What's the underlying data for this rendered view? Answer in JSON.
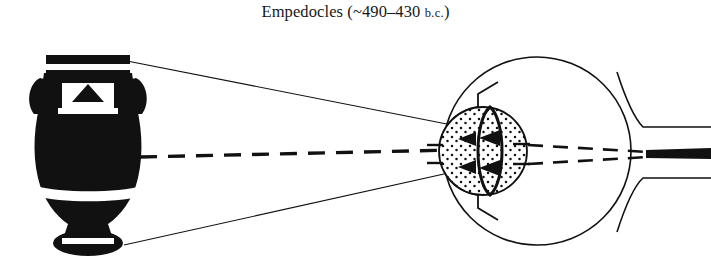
{
  "figure": {
    "caption_main": "Empedocles (~490–430 ",
    "caption_smallcaps": "b.c.",
    "caption_tail": ")",
    "caption_full": "Empedocles (~490–430 B.C.)",
    "background_color": "#ffffff",
    "ink_color": "#111111"
  },
  "objects": {
    "vase": {
      "name": "greek-amphora",
      "description": "black-figure amphora with white decorative bands",
      "fill_color": "#111111",
      "band_color": "#ffffff",
      "motif": "triangle-zigzag"
    },
    "eye": {
      "name": "human-eye-cross-section",
      "description": "eyeball sphere with stippled cornea region and lens",
      "outline_color": "#111111",
      "stipple_color": "#111111",
      "optic_nerve_color": "#111111"
    },
    "optic_nerve": {
      "name": "optic-nerve",
      "label": "optic nerve"
    }
  },
  "rays": {
    "visual_ray": {
      "name": "visual-ray-dashed-arrow",
      "style": "dashed",
      "direction": "eye-to-object",
      "arrowhead": "left",
      "color": "#111111"
    },
    "cone_lines": {
      "name": "visual-cone-lines",
      "style": "solid",
      "count": 2,
      "color": "#111111"
    },
    "inner_arrows": {
      "name": "internal-ray-arrowheads",
      "count": 4,
      "direction": "left",
      "color": "#111111"
    },
    "nerve_dashes": {
      "name": "optic-nerve-dashed-lines",
      "count": 2,
      "style": "dashed",
      "color": "#111111"
    }
  }
}
